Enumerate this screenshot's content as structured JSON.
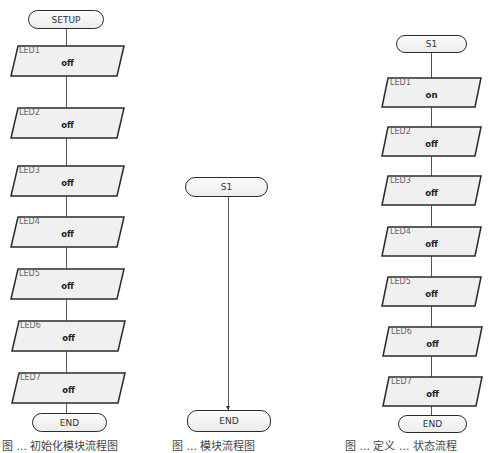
{
  "diagrams": [
    {
      "name": "setup-flowchart",
      "start": "SETUP",
      "steps": [
        {
          "label": "LED1",
          "value": "off"
        },
        {
          "label": "LED2",
          "value": "off"
        },
        {
          "label": "LED3",
          "value": "off"
        },
        {
          "label": "LED4",
          "value": "off"
        },
        {
          "label": "LED5",
          "value": "off"
        },
        {
          "label": "LED6",
          "value": "off"
        },
        {
          "label": "LED7",
          "value": "off"
        }
      ],
      "end": "END",
      "caption": "图 ... 初始化模块流程图"
    },
    {
      "name": "s1-module-flowchart",
      "start": "S1",
      "steps": [],
      "end": "END",
      "caption": "图 ... 模块流程图"
    },
    {
      "name": "s1-state-flowchart",
      "start": "S1",
      "steps": [
        {
          "label": "LED1",
          "value": "on"
        },
        {
          "label": "LED2",
          "value": "off"
        },
        {
          "label": "LED3",
          "value": "off"
        },
        {
          "label": "LED4",
          "value": "off"
        },
        {
          "label": "LED5",
          "value": "off"
        },
        {
          "label": "LED6",
          "value": "off"
        },
        {
          "label": "LED7",
          "value": "off"
        }
      ],
      "end": "END",
      "caption": "图 ... 定义 ... 状态流程"
    }
  ],
  "colors": {
    "stroke": "#2a2a2a",
    "fill": "#f0f0f0",
    "connector": "#555555"
  }
}
